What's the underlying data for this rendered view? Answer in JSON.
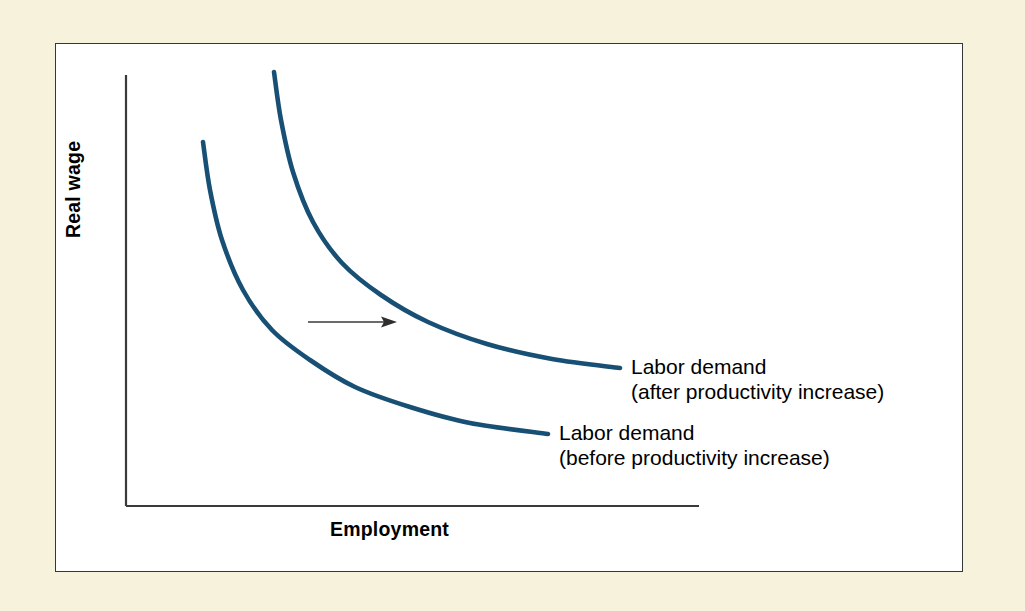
{
  "figure": {
    "background_color": "#f7f2dc",
    "panel_color": "#ffffff",
    "panel_border_color": "#35363a",
    "curve_color": "#175074",
    "axis_color": "#3a3a3c",
    "arrow_color": "#3a3a3c"
  },
  "chart_data": {
    "type": "line",
    "title": "",
    "subtitle": "",
    "xlabel": "Employment",
    "ylabel": "Real wage",
    "grid": false,
    "legend_position": "inline-right",
    "axis_ticks": {
      "x": [],
      "y": []
    },
    "xlim": [
      0,
      100
    ],
    "ylim": [
      0,
      100
    ],
    "annotations": [
      {
        "name": "shift-arrow",
        "type": "arrow",
        "direction": "right",
        "label": "",
        "x_start": 308,
        "x_end": 397,
        "y": 322
      }
    ],
    "series": [
      {
        "name": "labor-demand-before",
        "legend_line1": "Labor demand",
        "legend_line2": "(before productivity increase)",
        "color": "#175074",
        "points_px": [
          [
            203,
            142
          ],
          [
            210,
            190
          ],
          [
            222,
            240
          ],
          [
            243,
            290
          ],
          [
            272,
            330
          ],
          [
            310,
            360
          ],
          [
            355,
            387
          ],
          [
            410,
            407
          ],
          [
            470,
            423
          ],
          [
            548,
            434
          ]
        ]
      },
      {
        "name": "labor-demand-after",
        "legend_line1": "Labor demand",
        "legend_line2": "(after productivity increase)",
        "color": "#175074",
        "points_px": [
          [
            274,
            72
          ],
          [
            281,
            120
          ],
          [
            293,
            172
          ],
          [
            313,
            222
          ],
          [
            342,
            263
          ],
          [
            381,
            295
          ],
          [
            428,
            322
          ],
          [
            487,
            344
          ],
          [
            552,
            359
          ],
          [
            620,
            368
          ]
        ]
      }
    ]
  },
  "labels": {
    "x_axis": "Employment",
    "y_axis": "Real wage",
    "after": {
      "line1": "Labor demand",
      "line2": "(after productivity increase)"
    },
    "before": {
      "line1": "Labor demand",
      "line2": "(before productivity increase)"
    }
  }
}
